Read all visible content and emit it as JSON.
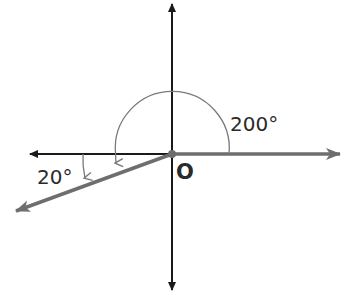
{
  "diagram": {
    "title": "",
    "origin_label": "O",
    "angles": [
      {
        "label": "200°",
        "value": 200,
        "direction": "counterclockwise",
        "from": "positive x-axis"
      },
      {
        "label": "20°",
        "value": 20,
        "direction": "clockwise",
        "from": "negative x-axis"
      }
    ],
    "colors": {
      "axis": "#1a1a1a",
      "ray": "#6e6e6e",
      "arc": "#7a7a7a",
      "text": "#2a2a2a"
    }
  }
}
